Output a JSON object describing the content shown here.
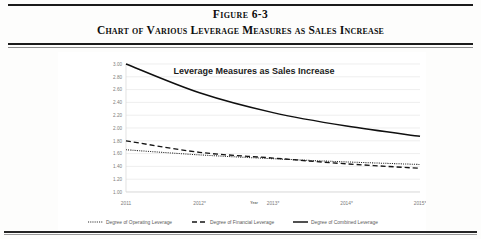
{
  "figure": {
    "number_label": "Figure 6-3",
    "caption": "Chart of Various Leverage Measures as Sales Increase"
  },
  "chart_data": {
    "type": "line",
    "title": "Leverage Measures as Sales Increase",
    "xlabel": "Year",
    "ylabel": "",
    "categories": [
      "2011",
      "2012*",
      "2013*",
      "2014*",
      "2015*"
    ],
    "ylim": [
      1.0,
      3.0
    ],
    "yticks": [
      "1.00",
      "1.20",
      "1.40",
      "1.60",
      "1.80",
      "2.00",
      "2.20",
      "2.40",
      "2.60",
      "2.80",
      "3.00"
    ],
    "grid": true,
    "legend_position": "bottom",
    "series": [
      {
        "name": "Degree of Operating Leverage",
        "style": "dotted",
        "values": [
          1.66,
          1.58,
          1.52,
          1.47,
          1.43
        ]
      },
      {
        "name": "Degree of Financial Leverage",
        "style": "dashed",
        "values": [
          1.8,
          1.62,
          1.53,
          1.44,
          1.37
        ]
      },
      {
        "name": "Degree of Combined Leverage",
        "style": "solid",
        "values": [
          3.0,
          2.55,
          2.24,
          2.03,
          1.87
        ]
      }
    ]
  }
}
